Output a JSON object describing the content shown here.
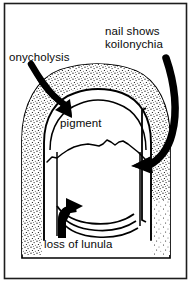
{
  "figure": {
    "background_color": "#ffffff",
    "ink_color": "#000000",
    "frame": {
      "present": true,
      "color": "#1a1a1a"
    },
    "labels": {
      "onycholysis": "onycholysis",
      "koilonychia_line1": "nail shows",
      "koilonychia_line2": "koilonychia",
      "pigment": "pigment",
      "lunula": "loss of lunula"
    },
    "annotations": {
      "arrow_onycholysis": "curved-arrow-pointing-down-right",
      "arrow_koilonychia": "curved-arrow-pointing-down-left",
      "arrow_lunula": "curved-arrow-pointing-up-right",
      "bracket_koilonychia": "vertical-bracket",
      "pigment_boundary": "wavy-line",
      "lunula_lines": "three-curved-lines",
      "finger_shading": "stipple-texture"
    }
  }
}
